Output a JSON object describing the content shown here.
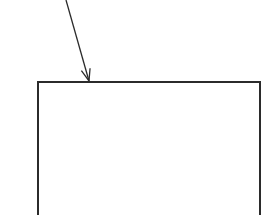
{
  "diagram": {
    "background": "#ffffff",
    "stroke_color": "#2b2b2b",
    "arrow": {
      "x1": 66,
      "y1": 0,
      "x2": 89,
      "y2": 81,
      "stroke_width": 1.3,
      "head": "open-v"
    },
    "box": {
      "x": 38,
      "y": 82,
      "width": 222,
      "height": 140,
      "stroke_width": 2,
      "label": ""
    }
  }
}
